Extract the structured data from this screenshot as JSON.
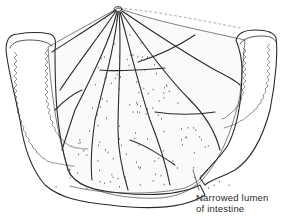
{
  "figure": {
    "stroke_color": "#2a2a2a",
    "fill_color": "#ffffff",
    "dot_color": "#555555"
  },
  "annotations": [
    {
      "id": "narrowed-lumen",
      "lines": [
        "Narrowed lumen",
        "of intestine"
      ]
    }
  ]
}
